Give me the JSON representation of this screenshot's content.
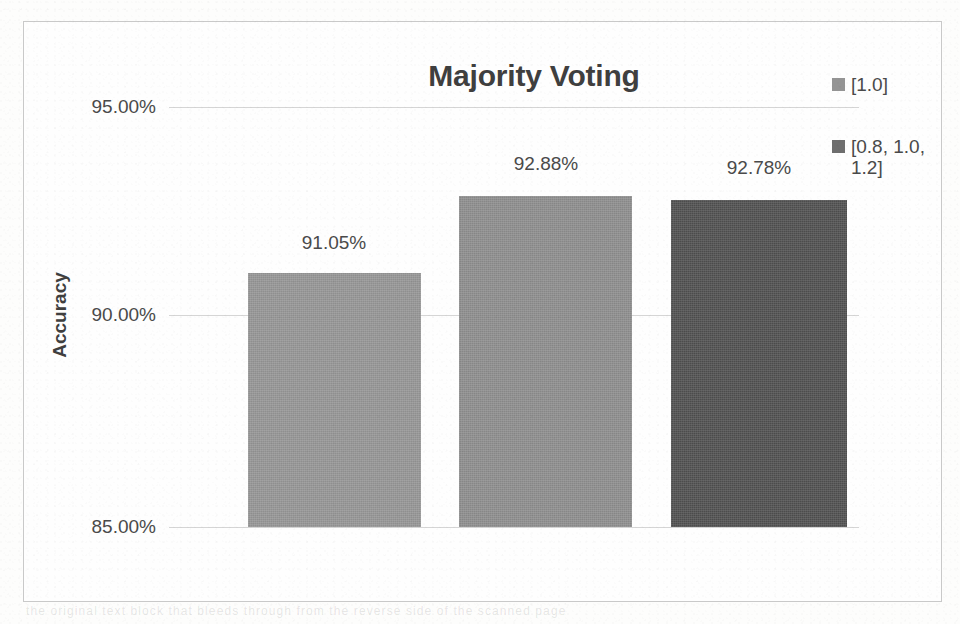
{
  "chart_data": {
    "type": "bar",
    "title": "Majority Voting",
    "xlabel": "",
    "ylabel": "Accuracy",
    "ylim": [
      85,
      95
    ],
    "yticks": [
      95,
      90,
      85
    ],
    "ytick_labels": [
      "95.00%",
      "90.00%",
      "85.00%"
    ],
    "grid": true,
    "legend_position": "right",
    "categories": [
      "bar-1",
      "bar-2",
      "bar-3"
    ],
    "values": [
      91.05,
      92.88,
      92.78
    ],
    "value_labels": [
      "91.05%",
      "92.88%",
      "92.78%"
    ],
    "bar_colors": [
      "#949494",
      "#8c8c8c",
      "#4f4f4f"
    ],
    "legend": [
      {
        "label": "[1.0]",
        "color": "#949494"
      },
      {
        "label": "[0.8, 1.0, 1.2]",
        "color": "#6e6e6e"
      }
    ]
  },
  "figure": {
    "background_color": "#fdfdfc",
    "frame_color": "#c9c9c9",
    "gridline_color": "#d5d5d5",
    "text_color": "#4a4a4a",
    "title_color": "#3f3f3f"
  },
  "bleed_through": {
    "text": "the original text block that bleeds through from the reverse side of the scanned page"
  }
}
